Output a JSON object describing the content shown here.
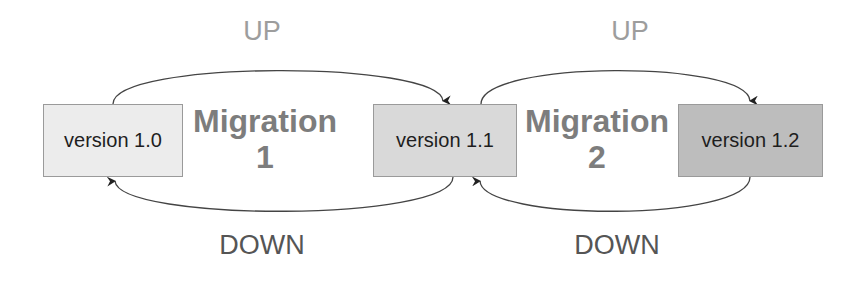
{
  "diagram": {
    "versions": [
      {
        "label": "version 1.0",
        "fill": "#ececec"
      },
      {
        "label": "version 1.1",
        "fill": "#d9d9d9"
      },
      {
        "label": "version 1.2",
        "fill": "#bdbdbd"
      }
    ],
    "migrations": [
      {
        "title": "Migration",
        "number": "1",
        "up_label": "UP",
        "down_label": "DOWN",
        "from": "version 1.0",
        "to": "version 1.1"
      },
      {
        "title": "Migration",
        "number": "2",
        "up_label": "UP",
        "down_label": "DOWN",
        "from": "version 1.1",
        "to": "version 1.2"
      }
    ],
    "colors": {
      "up_text": "#9d9d9d",
      "down_text": "#555555",
      "migration_text": "#7d7d7d",
      "arrow": "#333333"
    }
  }
}
